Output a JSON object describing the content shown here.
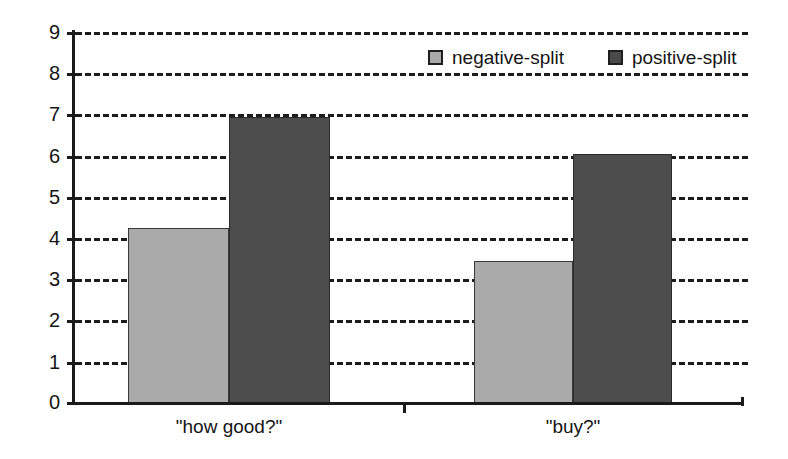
{
  "chart_data": {
    "type": "bar",
    "title": "",
    "subtitle": "",
    "xlabel": "",
    "ylabel": "",
    "categories": [
      "\"how good?\"",
      "\"buy?\""
    ],
    "series": [
      {
        "name": "negative-split",
        "color": "#aaaaaa",
        "values": [
          4.25,
          3.45
        ]
      },
      {
        "name": "positive-split",
        "color": "#4d4d4d",
        "values": [
          6.95,
          6.05
        ]
      }
    ],
    "ylim": [
      0,
      9
    ],
    "yticks": [
      0,
      1,
      2,
      3,
      4,
      5,
      6,
      7,
      8,
      9
    ],
    "ytick_labels": [
      "0",
      "1",
      "2",
      "3",
      "4",
      "5",
      "6",
      "7",
      "8",
      "9"
    ],
    "grid": true,
    "grid_style": "dashed",
    "grid_axis": "y",
    "legend_position": "top-right",
    "legend": [
      {
        "label": "negative-split",
        "swatch": "#a9a9a9"
      },
      {
        "label": "positive-split",
        "swatch": "#4a4a4a"
      }
    ],
    "axis_color": "#1a1a1a",
    "background": "#ffffff"
  }
}
